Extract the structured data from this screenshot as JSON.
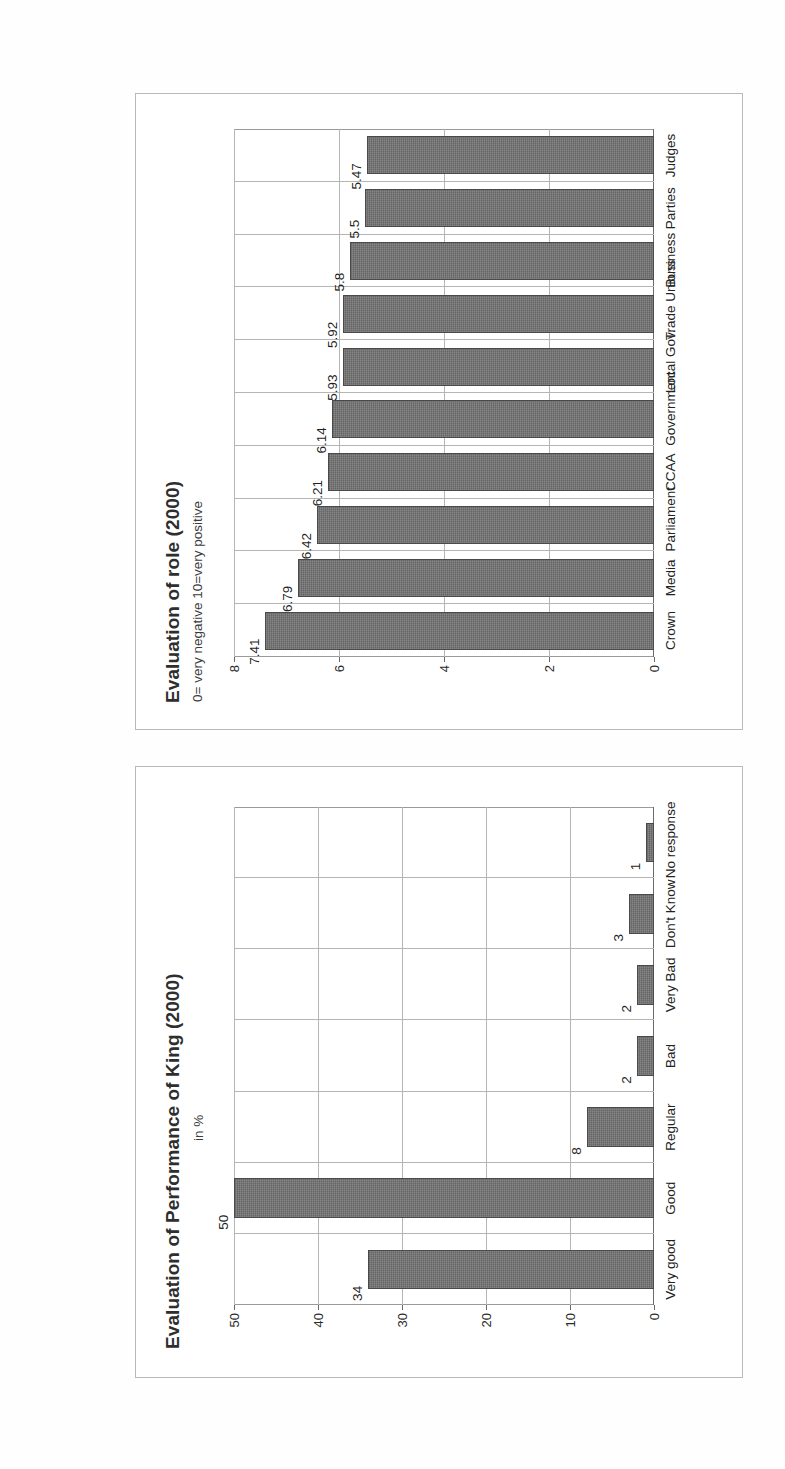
{
  "page": {
    "orientation_note": "rotated-90-ccw-scan"
  },
  "charts": [
    {
      "id": "king",
      "title": "Evaluation of Performance of King (2000)",
      "subtitle": "in %"
    },
    {
      "id": "role",
      "title": "Evaluation of role (2000)",
      "subtitle": "0= very negative 10=very positive"
    }
  ],
  "chart_data": [
    {
      "type": "bar",
      "title": "Evaluation of Performance of King (2000)",
      "subtitle": "in %",
      "xlabel": "",
      "ylabel": "",
      "ylim": [
        0,
        50
      ],
      "yticks": [
        0,
        10,
        20,
        30,
        40,
        50
      ],
      "ytick_labels": [
        "0",
        "10",
        "20",
        "30",
        "40",
        "50"
      ],
      "grid": true,
      "legend": "none",
      "categories": [
        "Very good",
        "Good",
        "Regular",
        "Bad",
        "Very Bad",
        "Don't Know",
        "No response"
      ],
      "values": [
        34,
        50,
        8,
        2,
        2,
        3,
        1
      ],
      "value_labels": [
        "34",
        "50",
        "8",
        "2",
        "2",
        "3",
        "1"
      ]
    },
    {
      "type": "bar",
      "title": "Evaluation of role (2000)",
      "subtitle": "0= very negative 10=very positive",
      "xlabel": "",
      "ylabel": "",
      "ylim": [
        0,
        8
      ],
      "yticks": [
        0,
        2,
        4,
        6,
        8
      ],
      "ytick_labels": [
        "0",
        "2",
        "4",
        "6",
        "8"
      ],
      "grid": true,
      "legend": "none",
      "categories": [
        "Crown",
        "Media",
        "Parliament",
        "CCAA",
        "Government",
        "Local Gov.",
        "Trade Unions",
        "Business",
        "Parties",
        "Judges"
      ],
      "values": [
        7.41,
        6.79,
        6.42,
        6.21,
        6.14,
        5.93,
        5.92,
        5.8,
        5.5,
        5.47
      ],
      "value_labels": [
        "7.41",
        "6.79",
        "6.42",
        "6.21",
        "6.14",
        "5.93",
        "5.92",
        "5.8",
        "5.5",
        "5.47"
      ]
    }
  ],
  "colors": {
    "bar_fill": "#6f6f6f",
    "bar_edge": "#4a4a4a",
    "grid": "#b5b5b5",
    "frame": "#b9b9b9",
    "text": "#222222",
    "page_background": "#ffffff"
  }
}
